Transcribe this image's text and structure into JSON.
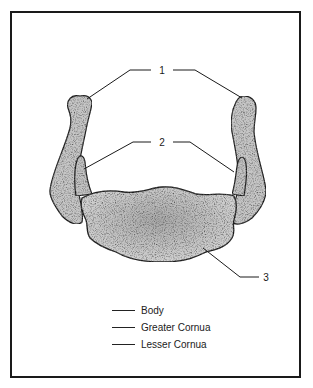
{
  "figure": {
    "callouts": [
      {
        "number": "1",
        "target": "Greater Cornua"
      },
      {
        "number": "2",
        "target": "Lesser Cornua"
      },
      {
        "number": "3",
        "target": "Body"
      }
    ]
  },
  "legend": {
    "items": [
      {
        "label": "Body"
      },
      {
        "label": "Greater Cornua"
      },
      {
        "label": "Lesser Cornua"
      }
    ]
  },
  "colors": {
    "bone_fill": "#c9c9c9",
    "outline": "#1a1a1a",
    "frame": "#1a1a1a"
  }
}
